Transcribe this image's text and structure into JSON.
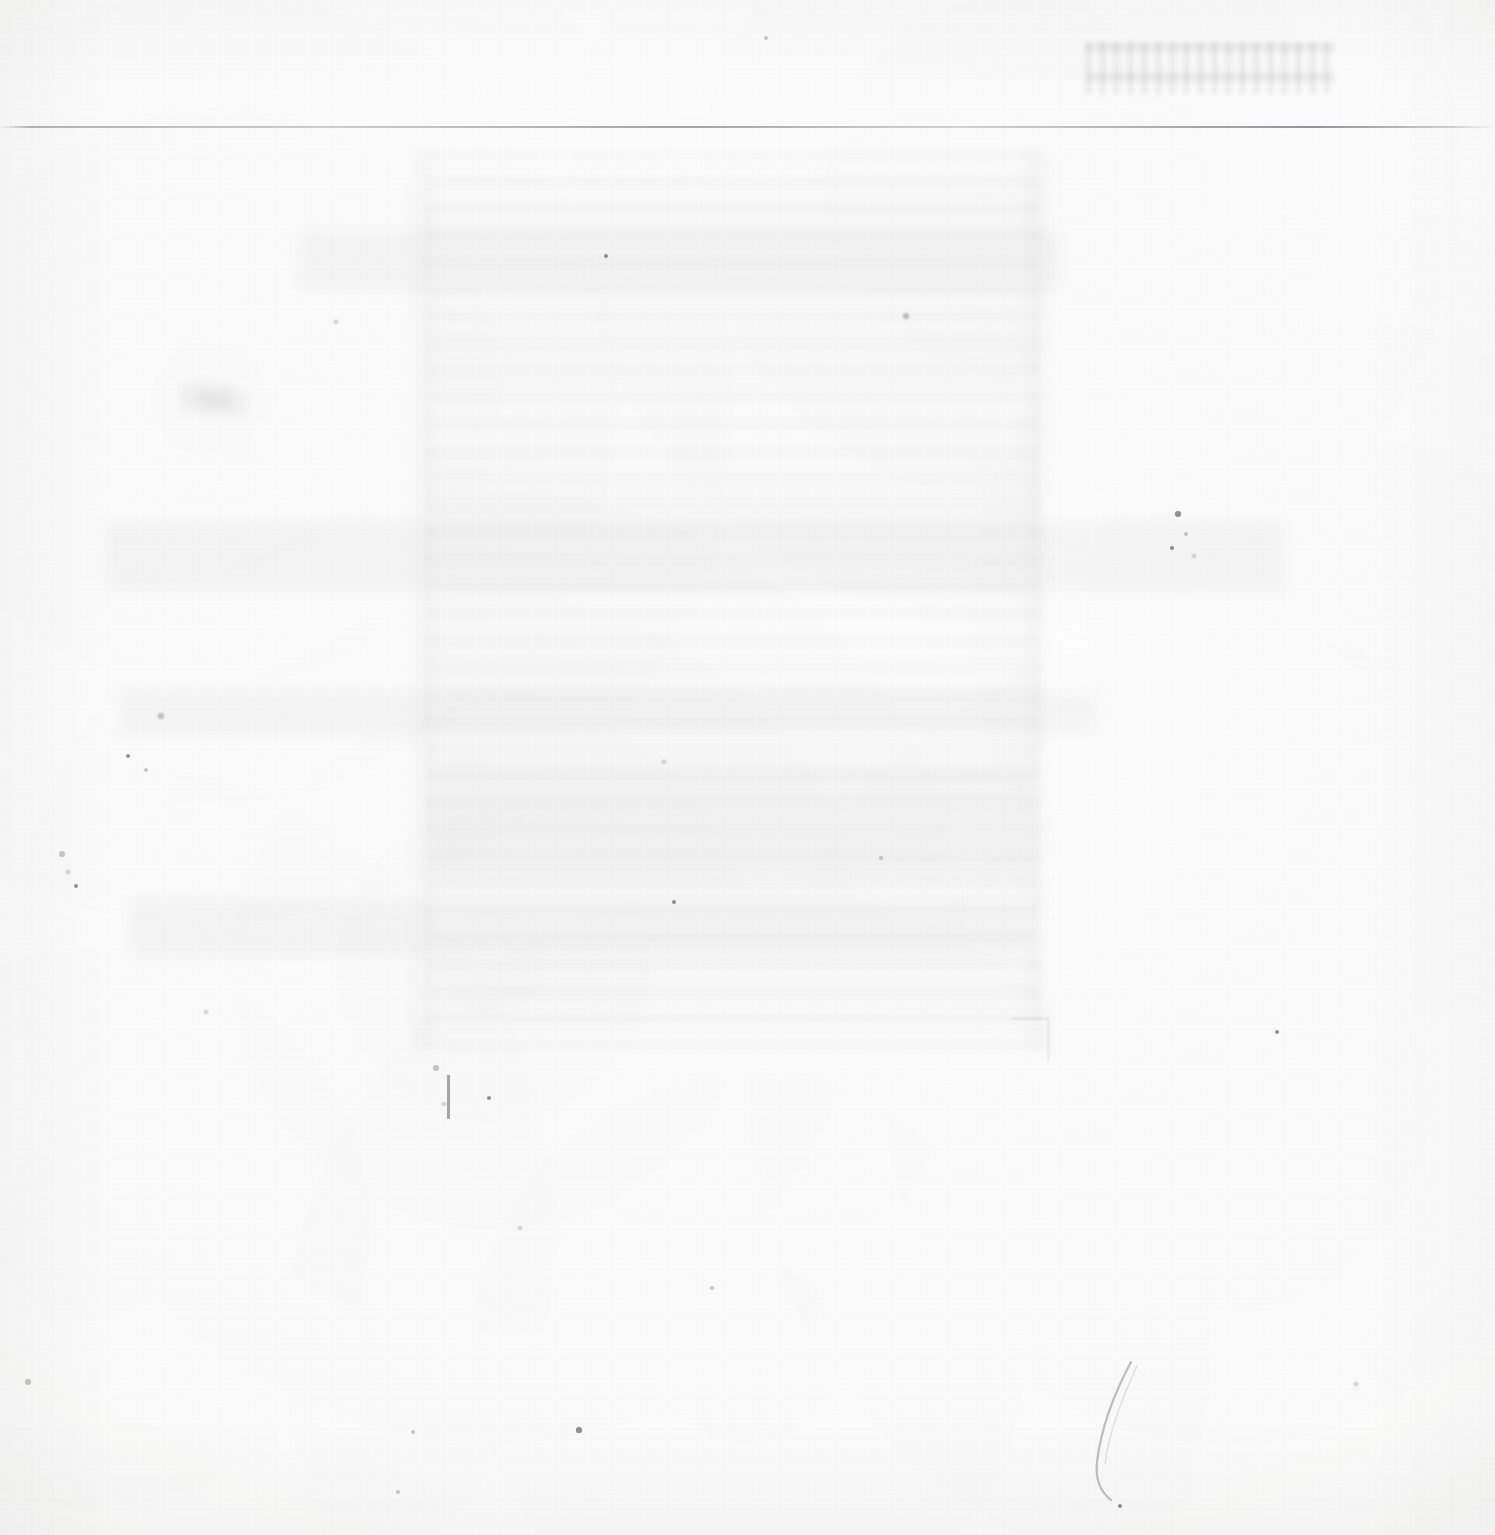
{
  "document": {
    "page_kind": "blank-scanned-page",
    "legible_text": "",
    "note": ""
  },
  "canvas": {
    "width": 1495,
    "height": 1535,
    "paper_color": "#fdfdfd",
    "edge_tone_color": "#f3f3f2"
  },
  "rule": {
    "top_rule": {
      "x": 0,
      "y": 126,
      "width": 1495,
      "height": 2,
      "color": "#6e6e76"
    }
  },
  "ghost": {
    "body_block": {
      "x": 425,
      "y": 150,
      "width": 615,
      "height": 900
    },
    "header": {
      "x": 1085,
      "y": 42,
      "width": 250,
      "height": 52
    },
    "vertical_edges": [
      {
        "x": 405,
        "y": 150,
        "width": 34,
        "height": 900
      },
      {
        "x": 1020,
        "y": 150,
        "width": 34,
        "height": 900
      }
    ],
    "bands": [
      {
        "x": 105,
        "y": 520,
        "width": 1180,
        "height": 72
      },
      {
        "x": 120,
        "y": 690,
        "width": 980,
        "height": 46
      },
      {
        "x": 130,
        "y": 900,
        "width": 900,
        "height": 56
      },
      {
        "x": 430,
        "y": 760,
        "width": 600,
        "height": 120
      },
      {
        "x": 300,
        "y": 230,
        "width": 760,
        "height": 60
      }
    ],
    "tone_color": "#000000"
  },
  "marks": {
    "smudge": {
      "x": 180,
      "y": 378,
      "width": 70,
      "height": 42
    },
    "corner_mark": {
      "x": 1012,
      "y": 1018,
      "width": 36,
      "height": 42
    },
    "scratch": {
      "x": 447,
      "y": 1075,
      "width": 3,
      "height": 44
    },
    "crease": {
      "x": 1085,
      "y": 1358,
      "width": 70,
      "height": 150
    },
    "specks": [
      {
        "x": 62,
        "y": 854,
        "r": 3.2
      },
      {
        "x": 68,
        "y": 872,
        "r": 2.4
      },
      {
        "x": 76,
        "y": 886,
        "r": 2.0
      },
      {
        "x": 28,
        "y": 1382,
        "r": 3.0
      },
      {
        "x": 161,
        "y": 716,
        "r": 2.6
      },
      {
        "x": 128,
        "y": 756,
        "r": 2.2
      },
      {
        "x": 146,
        "y": 770,
        "r": 2.0
      },
      {
        "x": 336,
        "y": 322,
        "r": 2.2
      },
      {
        "x": 606,
        "y": 256,
        "r": 2.0
      },
      {
        "x": 766,
        "y": 38,
        "r": 2.4
      },
      {
        "x": 906,
        "y": 316,
        "r": 2.6
      },
      {
        "x": 1178,
        "y": 514,
        "r": 2.8
      },
      {
        "x": 1186,
        "y": 534,
        "r": 2.2
      },
      {
        "x": 1194,
        "y": 556,
        "r": 2.0
      },
      {
        "x": 1172,
        "y": 548,
        "r": 1.8
      },
      {
        "x": 881,
        "y": 858,
        "r": 2.2
      },
      {
        "x": 664,
        "y": 762,
        "r": 2.0
      },
      {
        "x": 674,
        "y": 902,
        "r": 2.4
      },
      {
        "x": 436,
        "y": 1068,
        "r": 2.8
      },
      {
        "x": 444,
        "y": 1104,
        "r": 2.4
      },
      {
        "x": 489,
        "y": 1098,
        "r": 2.0
      },
      {
        "x": 712,
        "y": 1288,
        "r": 2.2
      },
      {
        "x": 520,
        "y": 1228,
        "r": 2.0
      },
      {
        "x": 579,
        "y": 1430,
        "r": 2.6
      },
      {
        "x": 413,
        "y": 1432,
        "r": 2.0
      },
      {
        "x": 1356,
        "y": 1384,
        "r": 2.2
      },
      {
        "x": 1120,
        "y": 1506,
        "r": 2.4
      },
      {
        "x": 398,
        "y": 1492,
        "r": 2.0
      },
      {
        "x": 206,
        "y": 1012,
        "r": 2.0
      },
      {
        "x": 1277,
        "y": 1032,
        "r": 2.2
      }
    ]
  }
}
